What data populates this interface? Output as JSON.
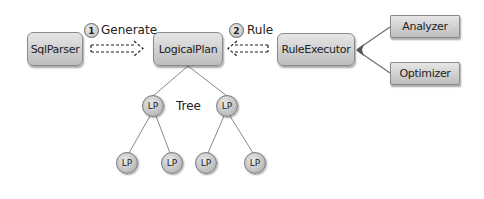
{
  "boxes": {
    "sqlparser": "SqlParser",
    "logicalplan": "LogicalPlan",
    "ruleexecutor": "RuleExecutor",
    "analyzer": "Analyzer",
    "optimizer": "Optimizer"
  },
  "arrows": {
    "generate": {
      "step": "1",
      "label": "Generate"
    },
    "rule": {
      "step": "2",
      "label": "Rule"
    }
  },
  "tree": {
    "label": "Tree",
    "nodes": [
      "LP",
      "LP",
      "LP",
      "LP",
      "LP",
      "LP"
    ]
  }
}
